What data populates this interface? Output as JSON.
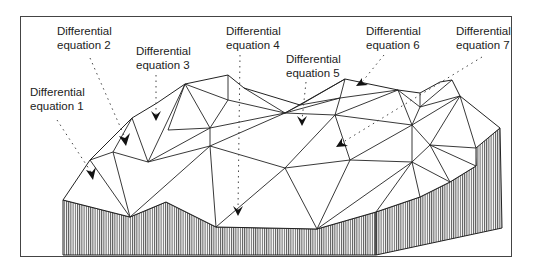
{
  "labels": [
    {
      "line1": "Differential",
      "line2": "equation 1",
      "x": 30,
      "y": 85
    },
    {
      "line1": "Differential",
      "line2": "equation 2",
      "x": 57,
      "y": 24
    },
    {
      "line1": "Differential",
      "line2": "equation 3",
      "x": 136,
      "y": 44
    },
    {
      "line1": "Differential",
      "line2": "equation 4",
      "x": 226,
      "y": 24
    },
    {
      "line1": "Differential",
      "line2": "equation 5",
      "x": 286,
      "y": 52
    },
    {
      "line1": "Differential",
      "line2": "equation 6",
      "x": 366,
      "y": 24
    },
    {
      "line1": "Differential",
      "line2": "equation 7",
      "x": 456,
      "y": 24
    }
  ],
  "colors": {
    "line": "#222222",
    "hatch": "#555555",
    "frame": "#444444",
    "background": "#ffffff"
  },
  "arrows": [
    {
      "from": [
        57,
        120
      ],
      "to": [
        93,
        175
      ]
    },
    {
      "from": [
        90,
        58
      ],
      "to": [
        126,
        140
      ]
    },
    {
      "from": [
        156,
        75
      ],
      "to": [
        156,
        115
      ]
    },
    {
      "from": [
        240,
        55
      ],
      "to": [
        238,
        210
      ]
    },
    {
      "from": [
        306,
        82
      ],
      "to": [
        302,
        120
      ]
    },
    {
      "from": [
        384,
        55
      ],
      "to": [
        362,
        82
      ]
    },
    {
      "from": [
        482,
        57
      ],
      "to": [
        340,
        144
      ]
    }
  ]
}
